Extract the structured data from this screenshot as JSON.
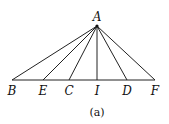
{
  "diagram": {
    "apex": {
      "label": "A",
      "x": 97,
      "y": 26
    },
    "baseline_y": 80,
    "points": [
      {
        "label": "B",
        "x": 12
      },
      {
        "label": "E",
        "x": 43
      },
      {
        "label": "C",
        "x": 69
      },
      {
        "label": "I",
        "x": 97
      },
      {
        "label": "D",
        "x": 127
      },
      {
        "label": "F",
        "x": 155
      }
    ],
    "caption": "(a)",
    "line_color": "#222222"
  }
}
